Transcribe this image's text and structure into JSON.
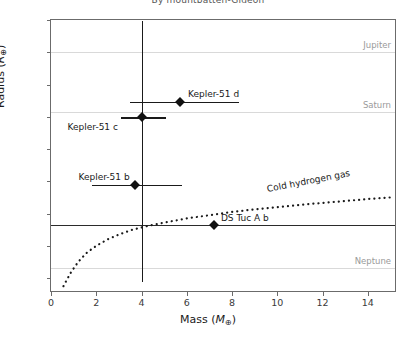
{
  "title": "By mountbatten-Gideon",
  "chart_data": {
    "type": "scatter",
    "title": "By mountbatten-Gideon",
    "xlabel": "Mass (M⊕)",
    "ylabel": "Radius (R⊕)",
    "xlim": [
      0,
      15.2
    ],
    "ylim": [
      3.6,
      12
    ],
    "grid": true,
    "legend_position": "none",
    "xticks": [
      0,
      2,
      4,
      6,
      8,
      10,
      12,
      14
    ],
    "yticks": [
      4,
      5,
      6,
      7,
      8,
      9,
      10,
      11,
      12
    ],
    "points": [
      {
        "name": "Kepler-51 d",
        "mass": 5.7,
        "radius": 9.46,
        "xerr_low": 2.2,
        "xerr_high": 2.6,
        "label_dx": 8,
        "label_dy": -12
      },
      {
        "name": "Kepler-51 c",
        "mass": 4.0,
        "radius": 8.98,
        "xerr_low": 0.9,
        "xerr_high": 1.1,
        "yerr_low": 5.1,
        "yerr_high": 3.0,
        "label_dx": -74,
        "label_dy": 6
      },
      {
        "name": "Kepler-51 b",
        "mass": 3.69,
        "radius": 6.89,
        "xerr_low": 1.9,
        "xerr_high": 2.1,
        "label_dx": -56,
        "label_dy": -12
      },
      {
        "name": "DS Tuc A b",
        "mass": 7.2,
        "radius": 5.65,
        "label_dx": 7,
        "label_dy": -11
      }
    ],
    "reference_lines": [
      {
        "name": "Jupiter",
        "radius": 11.0,
        "style": "dotted-grid"
      },
      {
        "name": "Saturn",
        "radius": 9.14,
        "style": "dotted-grid"
      },
      {
        "name": "Neptune",
        "radius": 4.3,
        "style": "dotted-grid"
      }
    ],
    "solid_lines": [
      {
        "radius": 5.65
      }
    ],
    "curve": {
      "name": "Cold hydrogen gas",
      "style": "dotted",
      "label": "Cold hydrogen gas",
      "x": [
        0.55,
        0.7,
        0.9,
        1.2,
        1.6,
        2.0,
        2.5,
        3.0,
        3.6,
        4.3,
        5.0,
        6.0,
        7.0,
        8.0,
        9.0,
        10.0,
        11.0,
        12.0,
        13.0,
        14.0,
        15.0
      ],
      "y": [
        3.75,
        3.95,
        4.2,
        4.5,
        4.8,
        5.0,
        5.2,
        5.35,
        5.5,
        5.62,
        5.72,
        5.85,
        5.95,
        6.05,
        6.13,
        6.2,
        6.27,
        6.33,
        6.39,
        6.45,
        6.5
      ]
    }
  }
}
